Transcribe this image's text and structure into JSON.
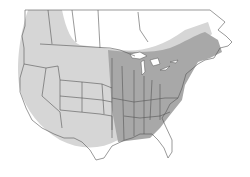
{
  "map": {
    "subject": "range map of North America",
    "regions": [
      {
        "name": "light-range",
        "color": "#d4d4d4",
        "extent": "western and central US, southern Canada"
      },
      {
        "name": "dark-range",
        "color": "#a9a9a9",
        "extent": "eastern US and southeastern Canada"
      }
    ],
    "colors": {
      "background": "#ffffff",
      "border": "#555555",
      "water": "#ffffff"
    }
  }
}
